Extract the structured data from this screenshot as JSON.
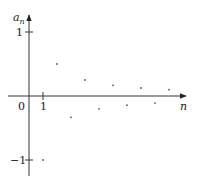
{
  "chart_data": {
    "type": "scatter",
    "title": "",
    "xlabel": "n",
    "ylabel": "a_n",
    "ylabel_main": "a",
    "ylabel_sub": "n",
    "origin_label": "0",
    "x_ticks": [
      {
        "value": 1,
        "label": "1"
      }
    ],
    "y_ticks": [
      {
        "value": 1,
        "label": "1"
      },
      {
        "value": -1,
        "label": "−1"
      }
    ],
    "xlim": [
      -1.5,
      10.7
    ],
    "ylim": [
      -1.2,
      1.35
    ],
    "grid": false,
    "legend": null,
    "x": [
      1,
      2,
      3,
      4,
      5,
      6,
      7,
      8,
      9,
      10
    ],
    "values": [
      -1,
      0.5,
      -0.333,
      0.25,
      -0.2,
      0.167,
      -0.143,
      0.125,
      -0.111,
      0.1
    ],
    "point_color": "#555555",
    "axis_color": "#333333"
  }
}
